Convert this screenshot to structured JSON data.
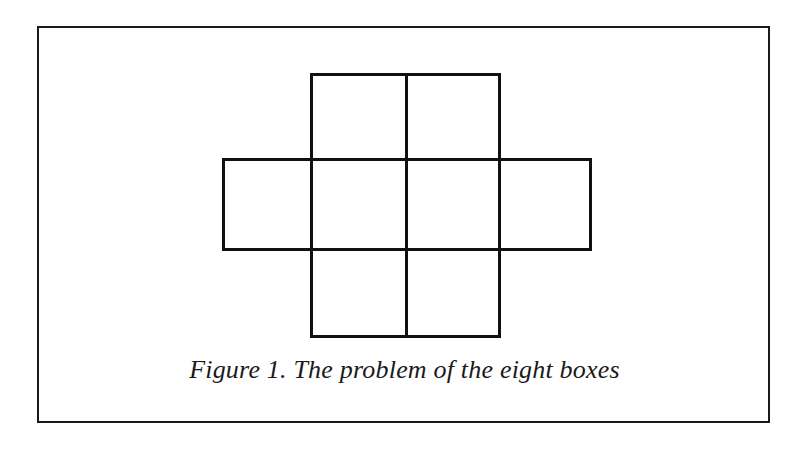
{
  "figure": {
    "caption": "Figure 1.  The problem of the eight boxes",
    "line_color": "#111111",
    "boxes": [
      {
        "id": "top-left",
        "row": 0,
        "col": 1
      },
      {
        "id": "top-right",
        "row": 0,
        "col": 2
      },
      {
        "id": "mid-far-left",
        "row": 1,
        "col": 0
      },
      {
        "id": "mid-left",
        "row": 1,
        "col": 1
      },
      {
        "id": "mid-right",
        "row": 1,
        "col": 2
      },
      {
        "id": "mid-far-right",
        "row": 1,
        "col": 3
      },
      {
        "id": "bottom-left",
        "row": 2,
        "col": 1
      },
      {
        "id": "bottom-right",
        "row": 2,
        "col": 2
      }
    ],
    "box_count": 8
  }
}
